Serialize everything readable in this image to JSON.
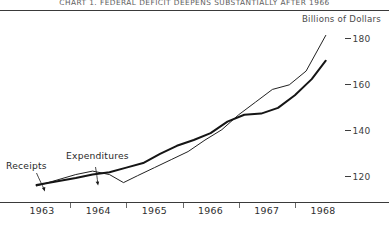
{
  "title": "CHART 1. FEDERAL DEFICIT DEEPENS SUBSTANTIALLY AFTER 1966",
  "unit_label": "Billions of Dollars",
  "series_labels": {
    "receipts": "Receipts",
    "expenditures": "Expenditures"
  },
  "chart_data": {
    "type": "line",
    "title": "CHART 1. FEDERAL DEFICIT DEEPENS SUBSTANTIALLY AFTER 1966",
    "subtitle": "Billions of Dollars",
    "xlabel": "",
    "ylabel": "Billions of Dollars",
    "grid": false,
    "legend": "inline-annotations",
    "xlim": [
      1962.75,
      1968.25
    ],
    "ylim": [
      113,
      190
    ],
    "yticks": [
      120,
      140,
      160,
      180
    ],
    "ytick_labels": [
      "-120",
      "-140",
      "-160",
      "-180"
    ],
    "xticks": [
      1963,
      1964,
      1965,
      1966,
      1967,
      1968
    ],
    "xtick_labels": [
      "1963",
      "1964",
      "1965",
      "1966",
      "1967",
      "1968"
    ],
    "x_minor_ticks": [
      1963.5,
      1964.5,
      1965.5,
      1966.5,
      1967.5
    ],
    "series": [
      {
        "name": "Receipts",
        "style": "thick",
        "x": [
          1962.9,
          1963.25,
          1963.6,
          1963.9,
          1964.2,
          1964.5,
          1964.8,
          1965.1,
          1965.4,
          1965.7,
          1966.0,
          1966.3,
          1966.6,
          1966.9,
          1967.2,
          1967.5,
          1967.8,
          1968.05
        ],
        "values": [
          117.0,
          118.5,
          120.0,
          121.5,
          122.5,
          124.5,
          126.5,
          130.5,
          134.0,
          136.5,
          139.5,
          144.5,
          147.5,
          148.0,
          150.5,
          156.0,
          163.0,
          171.0
        ]
      },
      {
        "name": "Expenditures",
        "style": "thin",
        "x": [
          1962.9,
          1963.25,
          1963.6,
          1963.9,
          1964.2,
          1964.45,
          1964.7,
          1965.0,
          1965.3,
          1965.6,
          1965.9,
          1966.2,
          1966.5,
          1966.8,
          1967.1,
          1967.4,
          1967.7,
          1968.05
        ],
        "values": [
          116.5,
          119.0,
          121.5,
          123.0,
          121.5,
          118.0,
          121.0,
          124.5,
          128.0,
          131.5,
          136.5,
          141.0,
          147.5,
          153.0,
          158.5,
          160.5,
          166.5,
          182.0
        ]
      }
    ],
    "annotations": [
      {
        "text": "Receipts",
        "points_to_series": "Receipts",
        "at_x": 1963.35
      },
      {
        "text": "Expenditures",
        "points_to_series": "Expenditures",
        "at_x": 1964.35
      }
    ]
  }
}
